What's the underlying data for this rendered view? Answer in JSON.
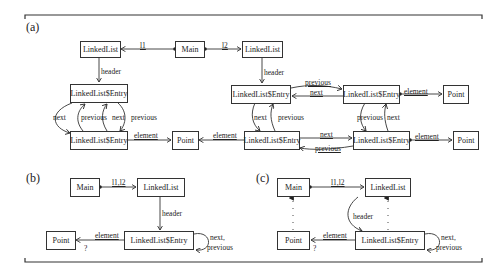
{
  "panels": {
    "a": {
      "label": "(a)",
      "nodes": {
        "linkedlist_l1": "LinkedList",
        "main": "Main",
        "linkedlist_l2": "LinkedList",
        "entry_a1": "LinkedList$Entry",
        "entry_a2": "LinkedList$Entry",
        "point_a": "Point",
        "entry_b1": "LinkedList$Entry",
        "entry_b2": "LinkedList$Entry",
        "entry_b3": "LinkedList$Entry",
        "entry_b4": "LinkedList$Entry",
        "point_b1": "Point",
        "point_b2": "Point"
      },
      "edges": {
        "l1": "l1",
        "l2": "l2",
        "header_1": "header",
        "header_2": "header",
        "next_1": "next",
        "previous_1": "previous",
        "next_2": "next",
        "previous_2": "previous",
        "element_1": "element",
        "element_2": "element",
        "previous_3": "previous",
        "next_3": "next",
        "next_4": "next",
        "previous_4": "previous",
        "element_3": "element",
        "previous_5": "previous",
        "next_5": "next",
        "next_6": "next",
        "previous_6": "previous",
        "element_4": "element"
      }
    },
    "b": {
      "label": "(b)",
      "nodes": {
        "main": "Main",
        "linkedlist": "LinkedList",
        "point": "Point",
        "entry": "LinkedList$Entry"
      },
      "edges": {
        "l1l2": "l1,l2",
        "header": "header",
        "element": "element",
        "multiplicity": "?",
        "self_loop_1": "next,",
        "self_loop_2": "previous"
      }
    },
    "c": {
      "label": "(c)",
      "nodes": {
        "main": "Main",
        "linkedlist": "LinkedList",
        "point": "Point",
        "entry": "LinkedList$Entry"
      },
      "edges": {
        "l1l2": "l1,l2",
        "header": "header",
        "element": "element",
        "multiplicity": "?",
        "self_loop_1": "next,",
        "self_loop_2": "previous"
      }
    }
  },
  "colors": {
    "line": "#333333",
    "background": "#ffffff"
  }
}
